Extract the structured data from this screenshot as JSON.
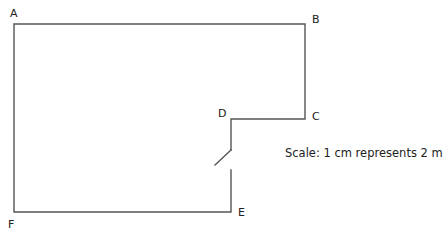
{
  "diagram": {
    "type": "floor-plan",
    "labels": {
      "A": "A",
      "B": "B",
      "C": "C",
      "D": "D",
      "E": "E",
      "F": "F"
    },
    "scale_text": "Scale: 1 cm represents 2 m",
    "line_color": "#555555",
    "vertices": {
      "A": [
        14,
        24
      ],
      "B": [
        305,
        24
      ],
      "C": [
        305,
        119
      ],
      "D": [
        231,
        119
      ],
      "E": [
        231,
        212
      ],
      "F": [
        14,
        212
      ]
    },
    "door": {
      "wall": "DE",
      "gap_from_y": 150,
      "gap_to_y": 170,
      "swing_end": [
        215,
        165
      ]
    }
  }
}
